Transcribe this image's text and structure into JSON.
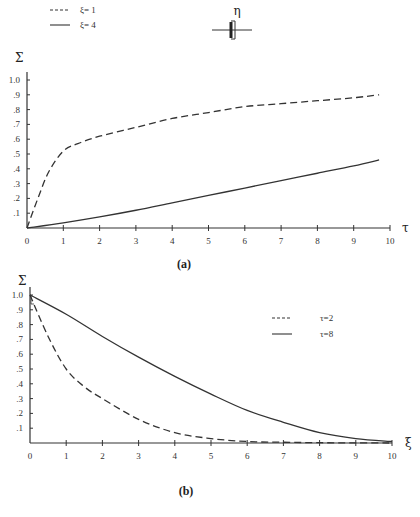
{
  "header": {
    "symbol": "η"
  },
  "chart_data": [
    {
      "type": "line",
      "caption": "(a)",
      "title": "",
      "xlabel": "τ",
      "ylabel": "Σ",
      "xlim": [
        0,
        10
      ],
      "ylim": [
        0,
        1.0
      ],
      "xticks": [
        "0",
        "1",
        "2",
        "3",
        "4",
        "5",
        "6",
        "7",
        "8",
        "9",
        "10"
      ],
      "yticks": [
        ".1",
        ".2",
        ".3",
        ".4",
        ".5",
        ".6",
        ".7",
        ".8",
        ".9",
        "1.0"
      ],
      "grid": false,
      "legend_position": "top-left",
      "series": [
        {
          "name": "ξ= 1",
          "style": "dashed",
          "x": [
            0,
            0.3,
            0.6,
            1.0,
            1.4,
            2,
            3,
            4,
            5,
            6,
            7,
            8,
            9,
            9.7
          ],
          "y": [
            0,
            0.2,
            0.38,
            0.52,
            0.57,
            0.62,
            0.68,
            0.74,
            0.78,
            0.82,
            0.84,
            0.86,
            0.88,
            0.9
          ]
        },
        {
          "name": "ξ= 4",
          "style": "solid",
          "x": [
            0,
            1,
            2,
            3,
            4,
            5,
            6,
            7,
            8,
            9,
            9.7
          ],
          "y": [
            0,
            0.035,
            0.075,
            0.12,
            0.17,
            0.22,
            0.27,
            0.32,
            0.37,
            0.42,
            0.46
          ]
        }
      ]
    },
    {
      "type": "line",
      "caption": "(b)",
      "title": "",
      "xlabel": "ξ",
      "ylabel": "Σ",
      "xlim": [
        0,
        10
      ],
      "ylim": [
        0,
        1.0
      ],
      "xticks": [
        "0",
        "1",
        "2",
        "3",
        "4",
        "5",
        "6",
        "7",
        "8",
        "9",
        "10"
      ],
      "yticks": [
        ".1",
        ".2",
        ".3",
        ".4",
        ".5",
        ".6",
        ".7",
        ".8",
        ".9",
        "1.0"
      ],
      "grid": false,
      "legend_position": "top-right",
      "series": [
        {
          "name": "τ=2",
          "style": "dashed",
          "x": [
            0,
            0.5,
            1,
            1.5,
            2,
            3,
            4,
            5,
            6,
            7,
            8,
            9,
            10
          ],
          "y": [
            1.0,
            0.72,
            0.5,
            0.38,
            0.3,
            0.16,
            0.07,
            0.03,
            0.01,
            0.005,
            0.002,
            0.001,
            0.0
          ]
        },
        {
          "name": "τ=8",
          "style": "solid",
          "x": [
            0,
            1,
            2,
            3,
            4,
            5,
            6,
            7,
            8,
            9,
            10
          ],
          "y": [
            1.0,
            0.87,
            0.72,
            0.58,
            0.45,
            0.33,
            0.22,
            0.14,
            0.07,
            0.03,
            0.01
          ]
        }
      ]
    }
  ]
}
